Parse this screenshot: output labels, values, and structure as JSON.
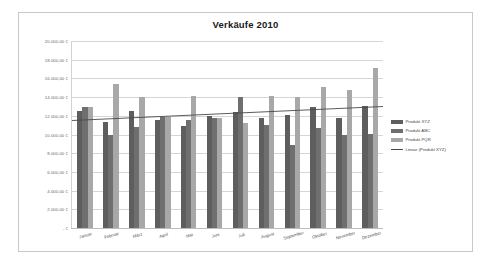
{
  "chart_data": {
    "type": "bar",
    "title": "Verkäufe 2010",
    "xlabel": "",
    "ylabel": "",
    "ylim": [
      0,
      20000
    ],
    "grid": true,
    "legend_position": "right",
    "categories": [
      "Januar",
      "Februar",
      "März",
      "April",
      "Mai",
      "Juni",
      "Juli",
      "August",
      "September",
      "Oktober",
      "November",
      "Dezember"
    ],
    "ytick_labels": [
      "- €",
      "2.000,00 €",
      "4.000,00 €",
      "6.000,00 €",
      "8.000,00 €",
      "10.000,00 €",
      "12.000,00 €",
      "14.000,00 €",
      "16.000,00 €",
      "18.000,00 €",
      "20.000,00 €"
    ],
    "ytick_values": [
      0,
      2000,
      4000,
      6000,
      8000,
      10000,
      12000,
      14000,
      16000,
      18000,
      20000
    ],
    "series": [
      {
        "name": "Produkt XYZ",
        "color": "#5e5e5e",
        "values": [
          12500,
          11300,
          12500,
          11500,
          10900,
          12000,
          12400,
          11800,
          12100,
          12900,
          11800,
          13000
        ]
      },
      {
        "name": "Produkt ABC",
        "color": "#6f6f6f",
        "values": [
          12900,
          10000,
          10800,
          11900,
          11500,
          11800,
          14000,
          11000,
          8900,
          10700,
          10000,
          10100
        ]
      },
      {
        "name": "Produkt PQR",
        "color": "#a8a8a8",
        "values": [
          12900,
          15400,
          14000,
          11900,
          14100,
          11800,
          11200,
          14100,
          14000,
          15100,
          14800,
          17100
        ]
      }
    ],
    "trendline": {
      "name": "Linear (Produkt XYZ)",
      "color": "#4a4a4a",
      "start_value": 11500,
      "end_value": 13000
    }
  },
  "legend": {
    "items": [
      {
        "label": "Produkt XYZ",
        "type": "swatch"
      },
      {
        "label": "Produkt ABC",
        "type": "swatch"
      },
      {
        "label": "Produkt PQR",
        "type": "swatch"
      },
      {
        "label": "Linear (Produkt XYZ)",
        "type": "line"
      }
    ]
  }
}
